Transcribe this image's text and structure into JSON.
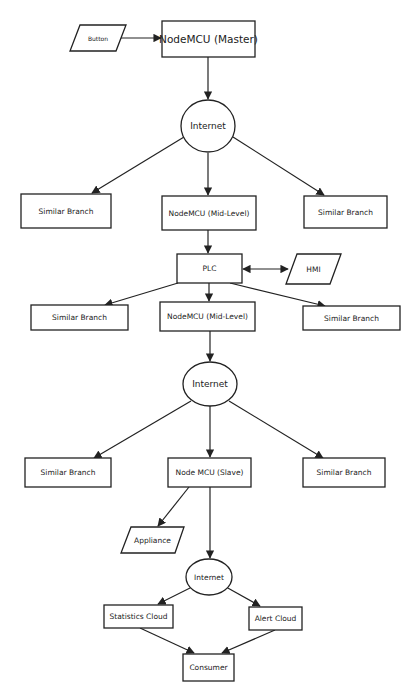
{
  "diagram": {
    "type": "flowchart",
    "stroke_color": "#222222",
    "background_color": "#ffffff",
    "nodes": {
      "button": {
        "label": "Button",
        "shape": "parallelogram"
      },
      "master": {
        "label": "NodeMCU (Master)",
        "shape": "rectangle"
      },
      "internet1": {
        "label": "Internet",
        "shape": "circle"
      },
      "branch_l1": {
        "label": "Similar Branch",
        "shape": "rectangle"
      },
      "midlevel1": {
        "label": "NodeMCU (Mid-Level)",
        "shape": "rectangle"
      },
      "branch_r1": {
        "label": "Similar Branch",
        "shape": "rectangle"
      },
      "plc": {
        "label": "PLC",
        "shape": "rectangle"
      },
      "hmi": {
        "label": "HMI",
        "shape": "parallelogram"
      },
      "branch_l2": {
        "label": "Similar Branch",
        "shape": "rectangle"
      },
      "midlevel2": {
        "label": "NodeMCU (Mid-Level)",
        "shape": "rectangle"
      },
      "branch_r2": {
        "label": "Similar Branch",
        "shape": "rectangle"
      },
      "internet2": {
        "label": "Internet",
        "shape": "circle"
      },
      "branch_l3": {
        "label": "Similar Branch",
        "shape": "rectangle"
      },
      "slave": {
        "label": "Node MCU (Slave)",
        "shape": "rectangle"
      },
      "branch_r3": {
        "label": "Similar Branch",
        "shape": "rectangle"
      },
      "appliance": {
        "label": "Appliance",
        "shape": "parallelogram"
      },
      "internet3": {
        "label": "Internet",
        "shape": "circle"
      },
      "stats_cloud": {
        "label": "Statistics Cloud",
        "shape": "rectangle"
      },
      "alert_cloud": {
        "label": "Alert Cloud",
        "shape": "rectangle"
      },
      "consumer": {
        "label": "Consumer",
        "shape": "rectangle"
      }
    },
    "edges": [
      {
        "from": "button",
        "to": "master"
      },
      {
        "from": "master",
        "to": "internet1"
      },
      {
        "from": "internet1",
        "to": "branch_l1"
      },
      {
        "from": "internet1",
        "to": "midlevel1"
      },
      {
        "from": "internet1",
        "to": "branch_r1"
      },
      {
        "from": "midlevel1",
        "to": "plc"
      },
      {
        "from": "plc",
        "to": "hmi",
        "bidirectional": true
      },
      {
        "from": "plc",
        "to": "branch_l2"
      },
      {
        "from": "plc",
        "to": "midlevel2"
      },
      {
        "from": "plc",
        "to": "branch_r2"
      },
      {
        "from": "midlevel2",
        "to": "internet2"
      },
      {
        "from": "internet2",
        "to": "branch_l3"
      },
      {
        "from": "internet2",
        "to": "slave"
      },
      {
        "from": "internet2",
        "to": "branch_r3"
      },
      {
        "from": "slave",
        "to": "appliance"
      },
      {
        "from": "slave",
        "to": "internet3"
      },
      {
        "from": "internet3",
        "to": "stats_cloud"
      },
      {
        "from": "internet3",
        "to": "alert_cloud"
      },
      {
        "from": "stats_cloud",
        "to": "consumer"
      },
      {
        "from": "alert_cloud",
        "to": "consumer"
      }
    ]
  }
}
